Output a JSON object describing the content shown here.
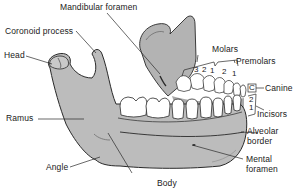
{
  "diagram": {
    "colors": {
      "bone": "#b9b9b9",
      "bone_shade": "#a6a6a6",
      "outline": "#2a2a2a",
      "tooth": "#ffffff",
      "background": "#ffffff"
    },
    "labels": {
      "mandibular_foramen": "Mandibular foramen",
      "coronoid_process": "Coronoid process",
      "head": "Head",
      "molars": "Molars",
      "premolars": "Premolars",
      "canine": "Canine",
      "incisors": "Incisors",
      "ramus": "Ramus",
      "alveolar_border_line1": "Alveolar",
      "alveolar_border_line2": "border",
      "angle": "Angle",
      "body": "Body",
      "mental_foramen_line1": "Mental",
      "mental_foramen_line2": "foramen"
    },
    "tooth_numbers": {
      "molar_3": "3",
      "molar_2": "2",
      "molar_1": "1",
      "premolar_2": "2",
      "premolar_1": "1",
      "canine": "C",
      "incisor_2": "2",
      "incisor_1": "1"
    }
  }
}
